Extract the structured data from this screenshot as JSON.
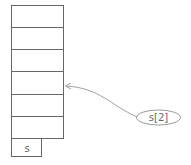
{
  "diagram": {
    "stack": {
      "cell_count": 6,
      "base_label": "s"
    },
    "pointer": {
      "label": "s[2]",
      "target_cell_index": 3
    },
    "colors": {
      "line": "#666666",
      "arrow": "#a0a0a0",
      "text": "#666666",
      "background": "#ffffff"
    }
  }
}
